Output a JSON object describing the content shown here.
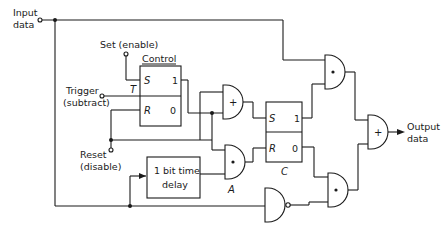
{
  "diagram": {
    "type": "logic-circuit",
    "inputs": {
      "input_data": [
        "Input",
        "data"
      ],
      "set": "Set (enable)",
      "trigger": [
        "Trigger",
        "(subtract)"
      ],
      "reset": [
        "Reset",
        "(disable)"
      ]
    },
    "output": [
      "Output",
      "data"
    ],
    "control_flipflop": {
      "title": "Control",
      "pin_s": "S",
      "pin_r": "R",
      "pin_t": "T",
      "out_1": "1",
      "out_0": "0"
    },
    "c_flipflop": {
      "label": "C",
      "pin_s": "S",
      "pin_r": "R",
      "out_1": "1",
      "out_0": "0"
    },
    "delay_block": [
      "1 bit time",
      "delay"
    ],
    "gates": {
      "or_left_symbol": "+",
      "and_a_symbol": "•",
      "and_a_label": "A",
      "and_top_symbol": "•",
      "and_bottom_symbol": "•",
      "or_out_symbol": "+",
      "nand_symbol": ""
    }
  }
}
